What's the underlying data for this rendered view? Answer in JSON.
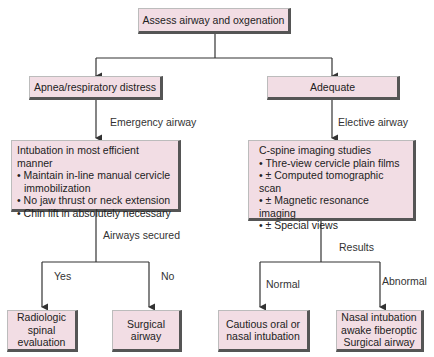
{
  "title_node": "Assess airway and oxgenation",
  "left": {
    "node": "Apnea/respiratory distress",
    "edge_label": "Emergency airway",
    "detail": {
      "heading": "Intubation in most efficient manner",
      "items": [
        "• Maintain in-line manual cervicle immobilization",
        "• No jaw thrust or neck extension",
        "• Chin lift in absolutely necessary"
      ]
    },
    "decision_label": "Airways secured",
    "yes_label": "Yes",
    "no_label": "No",
    "yes_node": "Radiologic spinal evaluation",
    "no_node": "Surgical airway"
  },
  "right": {
    "node": "Adequate",
    "edge_label": "Elective airway",
    "detail": {
      "heading": "C-spine imaging studies",
      "items": [
        "• Thre-view cervicle plain films",
        "• ± Computed tomographic scan",
        "• ± Magnetic resonance imaging",
        "• ± Special views"
      ]
    },
    "decision_label": "Results",
    "normal_label": "Normal",
    "abnormal_label": "Abnormal",
    "normal_node": "Cautious oral or nasal intubation",
    "abnormal_node_lines": [
      "Nasal intubation",
      "awake fiberoptic",
      "Surgical airway"
    ]
  },
  "colors": {
    "box_fill": "#f2dde4",
    "box_shadow": "#555555",
    "line": "#333333"
  }
}
